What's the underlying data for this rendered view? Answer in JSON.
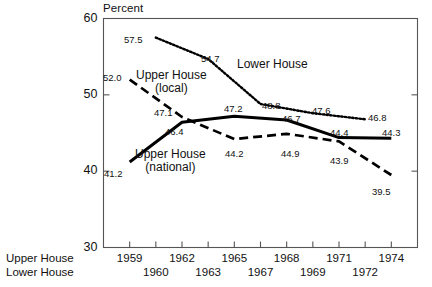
{
  "chart_data": {
    "type": "line",
    "title": "",
    "ylabel": "Percent",
    "xlabel": "",
    "ylim": [
      30,
      60
    ],
    "y_ticks": [
      "60",
      "50",
      "40",
      "30"
    ],
    "grid": false,
    "legend_position": "inline-annotations",
    "x_axis_rows": [
      {
        "row_label": "Upper House",
        "ticks": [
          "1959",
          "1962",
          "1965",
          "1968",
          "1971",
          "1974"
        ]
      },
      {
        "row_label": "Lower House",
        "ticks": [
          "1960",
          "1963",
          "1967",
          "1969",
          "1972"
        ]
      }
    ],
    "series": [
      {
        "name": "Lower House",
        "style": "dotted",
        "x": [
          "1960",
          "1963",
          "1967",
          "1969",
          "1972"
        ],
        "values": [
          57.5,
          54.7,
          48.8,
          47.6,
          46.8
        ]
      },
      {
        "name": "Upper House (national)",
        "style": "solid",
        "x": [
          "1959",
          "1962",
          "1965",
          "1968",
          "1971",
          "1974"
        ],
        "values": [
          41.2,
          46.4,
          47.2,
          46.7,
          44.4,
          44.3
        ]
      },
      {
        "name": "Upper House (local)",
        "style": "dashed",
        "x": [
          "1959",
          "1962",
          "1965",
          "1968",
          "1971",
          "1974"
        ],
        "values": [
          52.0,
          47.1,
          44.2,
          44.9,
          43.9,
          39.5
        ]
      }
    ],
    "point_labels": [
      {
        "text": "57.5",
        "x": 124,
        "y": 34
      },
      {
        "text": "54.7",
        "x": 201,
        "y": 53
      },
      {
        "text": "48.8",
        "x": 262,
        "y": 100
      },
      {
        "text": "47.6",
        "x": 312,
        "y": 105
      },
      {
        "text": "46.8",
        "x": 368,
        "y": 112
      },
      {
        "text": "52.0",
        "x": 103,
        "y": 72
      },
      {
        "text": "47.1",
        "x": 154,
        "y": 107
      },
      {
        "text": "44.2",
        "x": 225,
        "y": 148
      },
      {
        "text": "44.9",
        "x": 281,
        "y": 148
      },
      {
        "text": "43.9",
        "x": 330,
        "y": 155
      },
      {
        "text": "39.5",
        "x": 372,
        "y": 186
      },
      {
        "text": "41.2",
        "x": 104,
        "y": 168
      },
      {
        "text": "46.4",
        "x": 165,
        "y": 126
      },
      {
        "text": "47.2",
        "x": 224,
        "y": 103
      },
      {
        "text": "46.7",
        "x": 282,
        "y": 113
      },
      {
        "text": "44.4",
        "x": 330,
        "y": 127
      },
      {
        "text": "44.3",
        "x": 382,
        "y": 127
      }
    ],
    "series_annotations": [
      {
        "line1": "Upper House",
        "line2": "(local)",
        "x": 136,
        "y": 69
      },
      {
        "line1": "Lower House",
        "line2": "",
        "x": 237,
        "y": 58
      },
      {
        "line1": "Upper House",
        "line2": "(national)",
        "x": 135,
        "y": 148
      }
    ],
    "colors": {
      "line": "#000000",
      "axis": "#555555",
      "text": "#111111",
      "background": "#ffffff"
    }
  }
}
